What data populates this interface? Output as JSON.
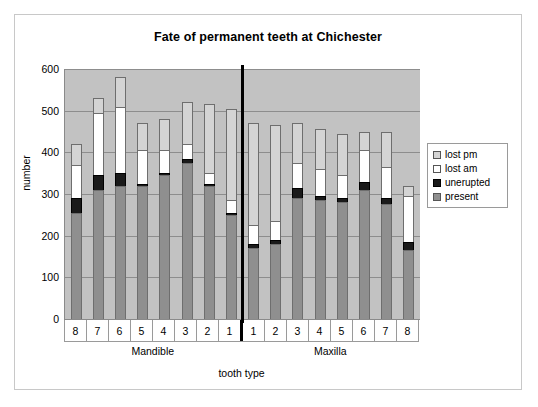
{
  "chart_data": {
    "type": "bar",
    "subtype": "stacked-column",
    "title": "Fate of permanent teeth at Chichester",
    "xlabel": "tooth type",
    "ylabel": "number",
    "ylim": [
      0,
      600
    ],
    "yticks": [
      0,
      100,
      200,
      300,
      400,
      500,
      600
    ],
    "grid": true,
    "legend_position": "right",
    "categories": [
      "8",
      "7",
      "6",
      "5",
      "4",
      "3",
      "2",
      "1",
      "1",
      "2",
      "3",
      "4",
      "5",
      "6",
      "7",
      "8"
    ],
    "groups": [
      {
        "label": "Mandible",
        "categories": [
          "8",
          "7",
          "6",
          "5",
          "4",
          "3",
          "2",
          "1"
        ]
      },
      {
        "label": "Maxilla",
        "categories": [
          "1",
          "2",
          "3",
          "4",
          "5",
          "6",
          "7",
          "8"
        ]
      }
    ],
    "series": [
      {
        "name": "present",
        "color": "#8f8f8f",
        "values": [
          255,
          310,
          320,
          320,
          345,
          375,
          320,
          250,
          170,
          180,
          290,
          285,
          280,
          310,
          275,
          165
        ]
      },
      {
        "name": "unerupted",
        "color": "#1a1a1a",
        "values": [
          35,
          35,
          30,
          5,
          5,
          10,
          5,
          5,
          10,
          10,
          25,
          10,
          10,
          20,
          15,
          20
        ]
      },
      {
        "name": "lost am",
        "color": "#ffffff",
        "values": [
          80,
          150,
          160,
          80,
          55,
          35,
          25,
          30,
          45,
          45,
          60,
          65,
          55,
          75,
          75,
          110
        ]
      },
      {
        "name": "lost pm",
        "color": "#d4d4d4",
        "values": [
          50,
          35,
          70,
          65,
          75,
          100,
          165,
          220,
          245,
          230,
          95,
          95,
          100,
          45,
          85,
          25
        ]
      }
    ],
    "totals": [
      420,
      530,
      580,
      470,
      480,
      520,
      515,
      505,
      470,
      465,
      470,
      455,
      445,
      450,
      450,
      320
    ]
  },
  "legend": {
    "items": [
      {
        "label": "lost pm",
        "swatch": "lostpm"
      },
      {
        "label": "lost am",
        "swatch": "lostam"
      },
      {
        "label": "unerupted",
        "swatch": "unerupted"
      },
      {
        "label": "present",
        "swatch": "present"
      }
    ]
  }
}
